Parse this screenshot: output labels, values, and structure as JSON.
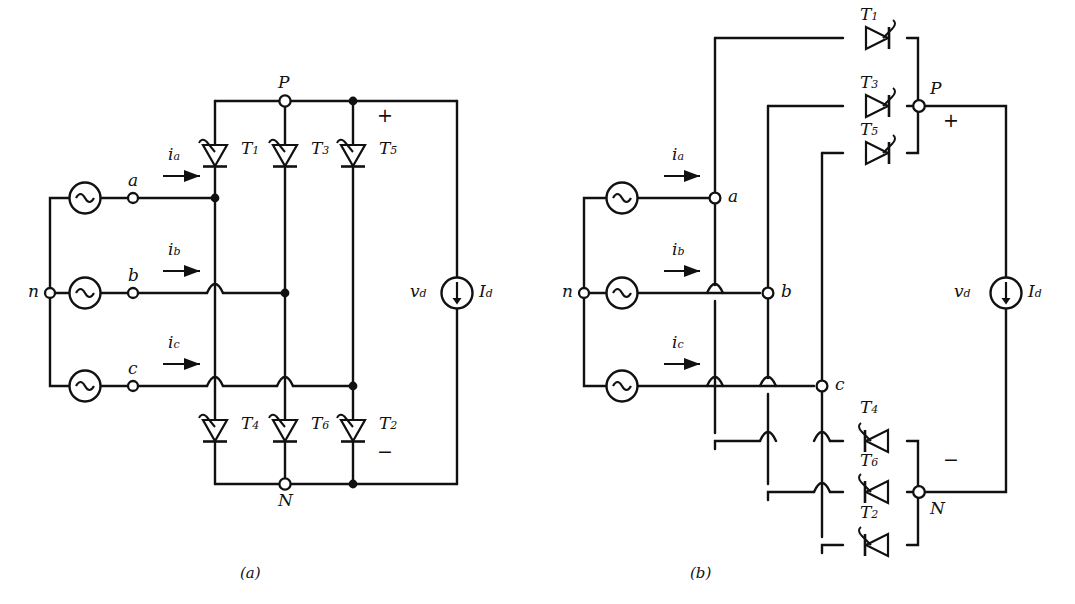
{
  "figure": {
    "captions": [
      {
        "key": "a",
        "label": "(a)",
        "x": 240,
        "y": 566
      },
      {
        "key": "b",
        "label": "(b)",
        "x": 690,
        "y": 566
      }
    ]
  },
  "diagram_a": {
    "name": "bridge-schematic",
    "nodes": [
      {
        "id": "n",
        "label": "n",
        "x": 50,
        "y": 293,
        "type": "open-terminal"
      },
      {
        "id": "a",
        "label": "a",
        "x": 133,
        "y": 198,
        "type": "open-terminal"
      },
      {
        "id": "b",
        "label": "b",
        "x": 133,
        "y": 293,
        "type": "open-terminal"
      },
      {
        "id": "c",
        "label": "c",
        "x": 133,
        "y": 386,
        "type": "open-terminal"
      },
      {
        "id": "P",
        "label": "P",
        "x": 285,
        "y": 101,
        "type": "open-terminal"
      },
      {
        "id": "N",
        "label": "N",
        "x": 285,
        "y": 484,
        "type": "open-terminal"
      }
    ],
    "sources": [
      {
        "id": "va",
        "icon": "ac-source-icon",
        "x": 85,
        "y": 198
      },
      {
        "id": "vb",
        "icon": "ac-source-icon",
        "x": 85,
        "y": 293
      },
      {
        "id": "vc",
        "icon": "ac-source-icon",
        "x": 85,
        "y": 386
      }
    ],
    "currents": [
      {
        "id": "ia",
        "label": "i",
        "sub": "a",
        "x": 168,
        "y": 156
      },
      {
        "id": "ib",
        "label": "i",
        "sub": "b",
        "x": 168,
        "y": 251
      },
      {
        "id": "ic",
        "label": "i",
        "sub": "c",
        "x": 168,
        "y": 344
      }
    ],
    "thyristors": [
      {
        "id": "T1",
        "label": "T",
        "sub": "1",
        "x": 215,
        "y": 155,
        "orient": "down",
        "label_x": 241,
        "label_y": 145
      },
      {
        "id": "T3",
        "label": "T",
        "sub": "3",
        "x": 285,
        "y": 155,
        "orient": "down",
        "label_x": 311,
        "label_y": 145
      },
      {
        "id": "T5",
        "label": "T",
        "sub": "5",
        "x": 353,
        "y": 155,
        "orient": "down",
        "label_x": 379,
        "label_y": 145
      },
      {
        "id": "T4",
        "label": "T",
        "sub": "4",
        "x": 215,
        "y": 430,
        "orient": "down",
        "label_x": 241,
        "label_y": 420
      },
      {
        "id": "T6",
        "label": "T",
        "sub": "6",
        "x": 285,
        "y": 430,
        "orient": "down",
        "label_x": 311,
        "label_y": 420
      },
      {
        "id": "T2",
        "label": "T",
        "sub": "2",
        "x": 353,
        "y": 430,
        "orient": "down",
        "label_x": 379,
        "label_y": 420
      }
    ],
    "dc_side": {
      "voltage_label": "v",
      "voltage_sub": "d",
      "v_x": 412,
      "v_y": 285,
      "current_source": {
        "icon": "dc-current-source-icon",
        "x": 457,
        "y": 293,
        "arrow": "down"
      },
      "current_label": "I",
      "current_sub": "d",
      "i_x": 480,
      "i_y": 285,
      "plus_sign": "+",
      "plus_x": 382,
      "plus_y": 113,
      "minus_sign": "−",
      "minus_x": 382,
      "minus_y": 450
    }
  },
  "diagram_b": {
    "name": "bridge-schematic-unfolded",
    "nodes": [
      {
        "id": "n",
        "label": "n",
        "x": 584,
        "y": 293,
        "type": "open-terminal"
      },
      {
        "id": "a",
        "label": "a",
        "x": 715,
        "y": 198,
        "type": "open-terminal"
      },
      {
        "id": "b",
        "label": "b",
        "x": 768,
        "y": 293,
        "type": "open-terminal"
      },
      {
        "id": "c",
        "label": "c",
        "x": 822,
        "y": 386,
        "type": "open-terminal"
      },
      {
        "id": "P",
        "label": "P",
        "x": 919,
        "y": 106,
        "type": "open-terminal"
      },
      {
        "id": "N",
        "label": "N",
        "x": 919,
        "y": 492,
        "type": "open-terminal"
      }
    ],
    "sources": [
      {
        "id": "va",
        "icon": "ac-source-icon",
        "x": 622,
        "y": 198
      },
      {
        "id": "vb",
        "icon": "ac-source-icon",
        "x": 622,
        "y": 293
      },
      {
        "id": "vc",
        "icon": "ac-source-icon",
        "x": 622,
        "y": 386
      }
    ],
    "currents": [
      {
        "id": "ia",
        "label": "i",
        "sub": "a",
        "x": 672,
        "y": 156
      },
      {
        "id": "ib",
        "label": "i",
        "sub": "b",
        "x": 672,
        "y": 251
      },
      {
        "id": "ic",
        "label": "i",
        "sub": "c",
        "x": 672,
        "y": 344
      }
    ],
    "thyristors": [
      {
        "id": "T1",
        "label": "T",
        "sub": "1",
        "x": 875,
        "y": 38,
        "orient": "right",
        "label_x": 862,
        "label_y": 11
      },
      {
        "id": "T3",
        "label": "T",
        "sub": "3",
        "x": 875,
        "y": 106,
        "orient": "right",
        "label_x": 862,
        "label_y": 79
      },
      {
        "id": "T5",
        "label": "T",
        "sub": "5",
        "x": 875,
        "y": 153,
        "orient": "right",
        "label_x": 862,
        "label_y": 126
      },
      {
        "id": "T4",
        "label": "T",
        "sub": "4",
        "x": 875,
        "y": 441,
        "orient": "left",
        "label_x": 862,
        "label_y": 405
      },
      {
        "id": "T6",
        "label": "T",
        "sub": "6",
        "x": 875,
        "y": 492,
        "orient": "left",
        "label_x": 862,
        "label_y": 458
      },
      {
        "id": "T2",
        "label": "T",
        "sub": "2",
        "x": 875,
        "y": 545,
        "orient": "left",
        "label_x": 862,
        "label_y": 510
      }
    ],
    "dc_side": {
      "voltage_label": "v",
      "voltage_sub": "d",
      "v_x": 956,
      "v_y": 285,
      "current_source": {
        "icon": "dc-current-source-icon",
        "x": 1006,
        "y": 293,
        "arrow": "down"
      },
      "current_label": "I",
      "current_sub": "d",
      "i_x": 1030,
      "i_y": 285,
      "plus_sign": "+",
      "plus_x": 948,
      "plus_y": 118,
      "minus_sign": "−",
      "minus_x": 948,
      "minus_y": 458
    }
  },
  "style": {
    "line_color": "#111111",
    "background": "#ffffff",
    "line_width": 2.4
  }
}
